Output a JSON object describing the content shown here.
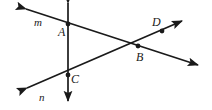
{
  "figure": {
    "type": "geometry-diagram",
    "width": 212,
    "height": 110,
    "background_color": "#ffffff",
    "stroke_color": "#1a1a1a",
    "label_color": "#1a1a1a"
  },
  "points": [
    {
      "id": "A",
      "label": "A",
      "x": 68,
      "y": 24,
      "label_x": 58,
      "label_y": 26,
      "dot": true
    },
    {
      "id": "B",
      "label": "B",
      "x": 138,
      "y": 46,
      "label_x": 136,
      "label_y": 51,
      "dot": true
    },
    {
      "id": "C",
      "label": "C",
      "x": 68,
      "y": 75,
      "label_x": 71,
      "label_y": 73,
      "dot": true
    },
    {
      "id": "D",
      "label": "D",
      "x": 162,
      "y": 31,
      "label_x": 152,
      "label_y": 16,
      "dot": true
    }
  ],
  "lines": [
    {
      "id": "m",
      "label": "m",
      "label_x": 34,
      "label_y": 17,
      "x1": 26,
      "y1": 9,
      "x2": 198,
      "y2": 65,
      "arrow_start": true,
      "arrow_end": true,
      "passes_through": [
        "A",
        "B"
      ]
    },
    {
      "id": "n",
      "label": "n",
      "label_x": 39,
      "label_y": 92,
      "x1": 27,
      "y1": 88,
      "x2": 182,
      "y2": 21,
      "arrow_start": true,
      "arrow_end": true,
      "passes_through": [
        "C",
        "B",
        "D"
      ]
    },
    {
      "id": "vertical",
      "label": "",
      "label_x": 0,
      "label_y": 0,
      "x1": 68,
      "y1": 3,
      "x2": 68,
      "y2": 101,
      "arrow_start": true,
      "arrow_end": true,
      "passes_through": [
        "A",
        "C"
      ]
    }
  ]
}
